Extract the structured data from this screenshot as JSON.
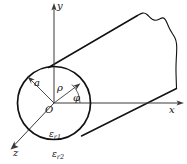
{
  "figure": {
    "kind": "geometry-diagram",
    "background_color": "#ffffff",
    "outline_color": "#111111",
    "axis_color": "#3a3a3a"
  },
  "axes": {
    "y_label": "y",
    "x_label": "x",
    "z_label": "z",
    "origin_label": "O"
  },
  "annotations": {
    "radius_label": "a",
    "rho_label": "ρ",
    "phi_label": "φ"
  },
  "media": {
    "inner": {
      "symbol": "ε",
      "subscript": "r1"
    },
    "outer": {
      "symbol": "ε",
      "subscript": "r2"
    }
  }
}
